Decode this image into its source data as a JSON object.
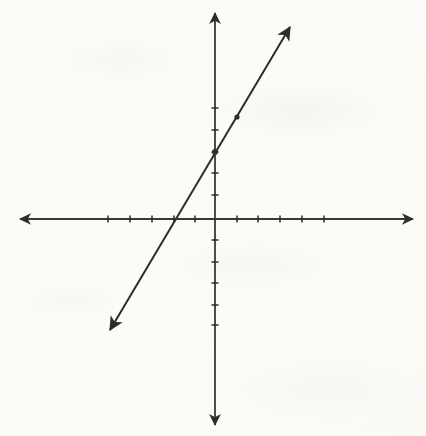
{
  "figure": {
    "name": "coordinate-plane-line-graph",
    "background_color": "#fdfdfa",
    "ink_color": "#2f2d28",
    "width": 426,
    "height": 436
  },
  "chart_data": {
    "type": "line",
    "title": "",
    "xlabel": "",
    "ylabel": "",
    "grid": false,
    "legend": null,
    "axes": {
      "origin_px": [
        215,
        219
      ],
      "unit_px": 21.7,
      "xlim": [
        -9,
        9
      ],
      "ylim": [
        -9.5,
        9.5
      ],
      "x_axis": {
        "name": "x-axis",
        "start_px": [
          20,
          219
        ],
        "end_px": [
          413,
          219
        ],
        "arrowheads": "both",
        "tick_values": [
          -5,
          -4,
          -3,
          -2,
          -1,
          1,
          2,
          3,
          4,
          5
        ],
        "tick_px": [
          108,
          130,
          152,
          174,
          195,
          237,
          258,
          280,
          302,
          324
        ],
        "tick_length_px": 7,
        "tick_labels_shown": false
      },
      "y_axis": {
        "name": "y-axis",
        "start_px": [
          215,
          13
        ],
        "end_px": [
          215,
          425
        ],
        "arrowheads": "both",
        "tick_values": [
          5,
          4,
          3,
          2,
          1,
          -1,
          -2,
          -3,
          -4,
          -5
        ],
        "tick_px": [
          108,
          130,
          152,
          173,
          195,
          240,
          262,
          283,
          305,
          325
        ],
        "tick_length_px": 7,
        "tick_labels_shown": false
      }
    },
    "series": [
      {
        "name": "plotted-line",
        "equation": "y = 2x + 3",
        "slope": 2,
        "y_intercept": 3,
        "x_intercept": -1.5,
        "arrowheads": "both",
        "endpoint_start_px": [
          110,
          330
        ],
        "endpoint_end_px": [
          290,
          27
        ],
        "marked_points": [
          {
            "name": "y-intercept-point",
            "x": 0,
            "y": 3,
            "px": [
              215,
              152
            ]
          },
          {
            "name": "second-point",
            "x": 1,
            "y": 5,
            "px": [
              237,
              117
            ]
          }
        ]
      }
    ]
  }
}
